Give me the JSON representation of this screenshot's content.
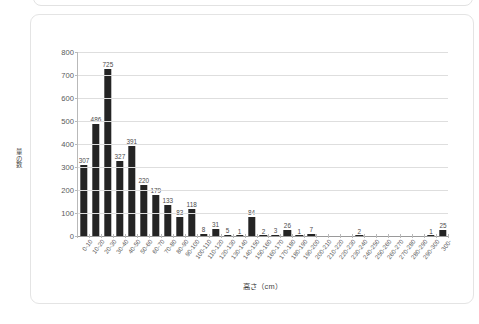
{
  "side_caption": "graph 6  サイズ別",
  "chart_data": {
    "type": "bar",
    "title": "",
    "xlabel": "高さ（cm）",
    "ylabel": "量の数",
    "ylim": [
      0,
      800
    ],
    "ytick_values": [
      0,
      100,
      200,
      300,
      400,
      500,
      600,
      700,
      800
    ],
    "ytick_labels": [
      "0",
      "100",
      "200",
      "300",
      "400",
      "500",
      "600",
      "700",
      "800"
    ],
    "grid": true,
    "legend": "none",
    "bar_color": "#242424",
    "categories": [
      "0-10",
      "10-20",
      "20-30",
      "30-40",
      "40-50",
      "50-60",
      "60-70",
      "70-80",
      "80-90",
      "90-100",
      "100-110",
      "110-120",
      "120-130",
      "130-140",
      "140-150",
      "150-160",
      "160-170",
      "170-180",
      "180-190",
      "190-200",
      "200-210",
      "210-220",
      "220-230",
      "230-240",
      "240-250",
      "250-260",
      "260-270",
      "270-280",
      "280-290",
      "290-300",
      "300-"
    ],
    "values": [
      307,
      486,
      725,
      327,
      391,
      220,
      179,
      133,
      83,
      118,
      8,
      31,
      5,
      1,
      84,
      2,
      3,
      26,
      1,
      7,
      0,
      0,
      0,
      2,
      0,
      0,
      0,
      0,
      0,
      1,
      25
    ],
    "value_labels": [
      "307",
      "486",
      "725",
      "327",
      "391",
      "220",
      "179",
      "133",
      "83",
      "118",
      "8",
      "31",
      "5",
      "1",
      "84",
      "2",
      "3",
      "26",
      "1",
      "7",
      "",
      "",
      "",
      "2",
      "",
      "",
      "",
      "",
      "",
      "1",
      "25"
    ]
  }
}
